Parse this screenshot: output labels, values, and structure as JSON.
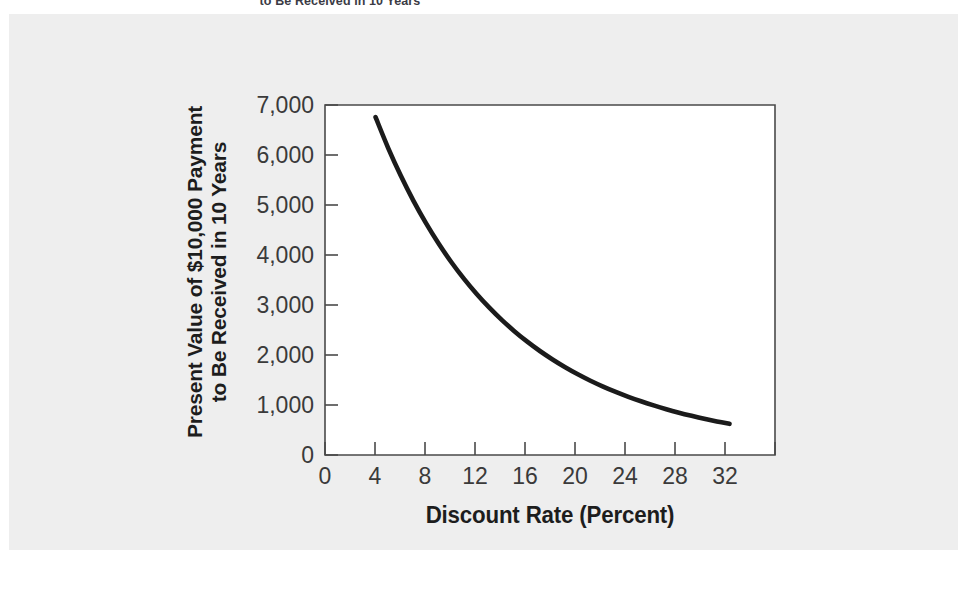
{
  "caption": "to Be Received in 10 Years",
  "colors": {
    "page_background": "#ffffff",
    "panel_background": "#eeeeee",
    "plot_background": "#ffffff",
    "curve": "#1b1b1b",
    "axis": "#4a4a4a",
    "tick_text": "#3a3a3a",
    "axis_title": "#1d1d1d"
  },
  "chart_data": {
    "type": "line",
    "title": "",
    "xlabel": "Discount Rate (Percent)",
    "ylabel_line1": "Present Value of $10,000 Payment",
    "ylabel_line2": "to Be Received in 10 Years",
    "xlim": [
      0,
      35.6
    ],
    "ylim": [
      0,
      7000
    ],
    "xticks": [
      0,
      4,
      8,
      12,
      16,
      20,
      24,
      28,
      32
    ],
    "xtick_labels": [
      "0",
      "4",
      "8",
      "12",
      "16",
      "20",
      "24",
      "28",
      "32"
    ],
    "yticks": [
      0,
      1000,
      2000,
      3000,
      4000,
      5000,
      6000,
      7000
    ],
    "ytick_labels": [
      "0",
      "1,000",
      "2,000",
      "3,000",
      "4,000",
      "5,000",
      "6,000",
      "7,000"
    ],
    "grid": false,
    "legend": "none",
    "series": [
      {
        "name": "Present Value of $10,000 in 10 Years",
        "formula": "PV = 10000 / (1 + r)^10",
        "x": [
          4,
          5,
          6,
          7,
          8,
          9,
          10,
          11,
          12,
          13,
          14,
          15,
          16,
          17,
          18,
          19,
          20,
          21,
          22,
          23,
          24,
          25,
          26,
          27,
          28,
          29,
          30,
          31,
          32
        ],
        "y": [
          6756,
          6139,
          5584,
          5083,
          4632,
          4224,
          3855,
          3522,
          3220,
          2946,
          2697,
          2472,
          2267,
          2080,
          1911,
          1756,
          1615,
          1486,
          1369,
          1262,
          1164,
          1074,
          992,
          916,
          847,
          784,
          725,
          672,
          623
        ]
      }
    ],
    "annotations": []
  }
}
